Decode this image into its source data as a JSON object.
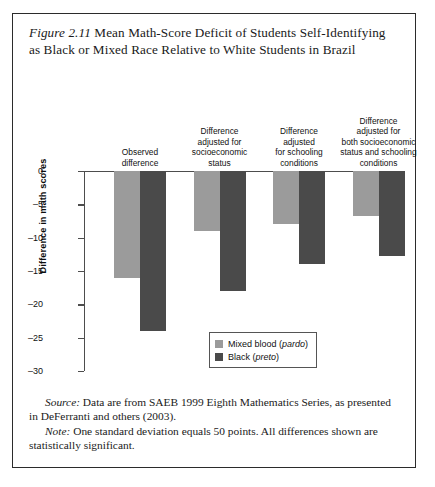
{
  "figure": {
    "number": "Figure 2.11",
    "title": "Mean Math-Score Deficit of Students Self-Identifying as Black or Mixed Race Relative to White Students in Brazil"
  },
  "notes": {
    "source_lead": "Source:",
    "source_text": " Data are from SAEB 1999 Eighth Mathematics Series, as presented in DeFerranti and others (2003).",
    "note_lead": "Note:",
    "note_text": " One standard deviation equals 50 points. All differences shown are statistically significant."
  },
  "legend": {
    "items": [
      {
        "label_plain": "Mixed blood (",
        "label_italic": "pardo",
        "label_tail": ")",
        "color": "#9b9b9b"
      },
      {
        "label_plain": "Black (",
        "label_italic": "preto",
        "label_tail": ")",
        "color": "#4a4a4a"
      }
    ]
  },
  "chart_data": {
    "type": "bar",
    "title": "Mean Math-Score Deficit of Students Self-Identifying as Black or Mixed Race Relative to White Students in Brazil",
    "xlabel": "",
    "ylabel": "Difference in math scores",
    "ylim": [
      -30,
      0
    ],
    "yticks": [
      0,
      -5,
      -10,
      -15,
      -20,
      -25,
      -30
    ],
    "ytick_labels": [
      "0",
      "–5",
      "–10",
      "–15",
      "–20",
      "–25",
      "–30"
    ],
    "grid": false,
    "legend_position": "inside lower center",
    "categories": [
      "Observed difference",
      "Difference adjusted for socioeconomic status",
      "Difference adjusted for schooling conditions",
      "Difference adjusted for both socioeconomic status and schooling conditions"
    ],
    "category_lines": [
      [
        "Observed",
        "difference"
      ],
      [
        "Difference",
        "adjusted for",
        "socioeconomic",
        "status"
      ],
      [
        "Difference",
        "adjusted",
        "for schooling",
        "conditions"
      ],
      [
        "Difference",
        "adjusted for",
        "both socioeconomic",
        "status and schooling",
        "conditions"
      ]
    ],
    "series": [
      {
        "name": "Mixed blood (pardo)",
        "color": "#9b9b9b",
        "values": [
          -16,
          -9,
          -8,
          -6.7
        ]
      },
      {
        "name": "Black (preto)",
        "color": "#4a4a4a",
        "values": [
          -24,
          -18,
          -14,
          -12.7
        ]
      }
    ]
  }
}
